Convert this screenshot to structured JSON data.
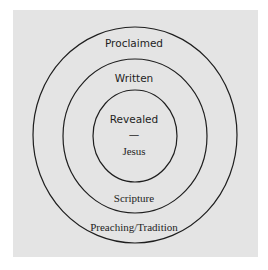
{
  "diagram": {
    "type": "concentric-circles",
    "colors": {
      "background": "#e4e4e4",
      "stroke": "#1e1e1e",
      "text": "#1e1e1e"
    },
    "rings": [
      {
        "name": "outer",
        "top_label": "Proclaimed",
        "bottom_label": "Preaching/Tradition"
      },
      {
        "name": "middle",
        "top_label": "Written",
        "bottom_label": "Scripture"
      },
      {
        "name": "inner",
        "top_label": "Revealed",
        "separator": "—",
        "bottom_label": "Jesus"
      }
    ]
  }
}
